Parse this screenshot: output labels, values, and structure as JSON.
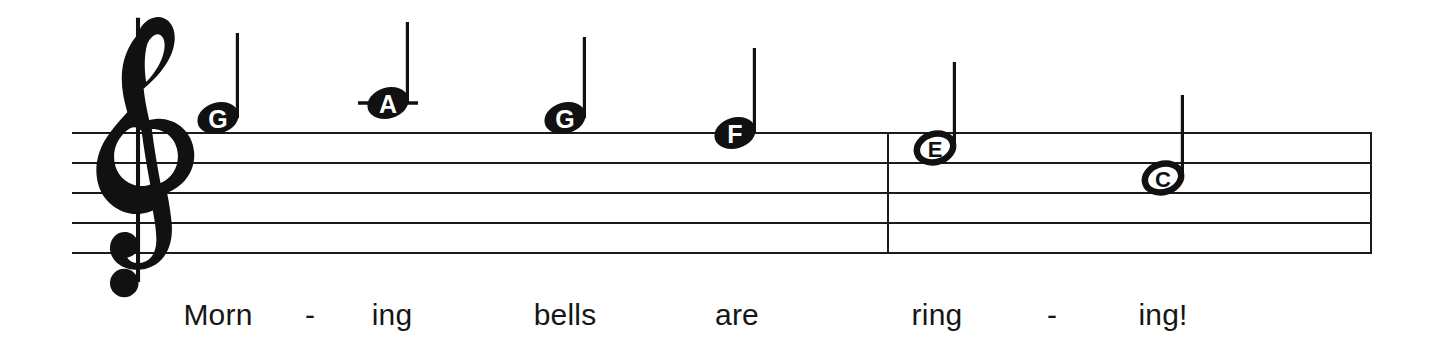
{
  "score": {
    "title_text": "",
    "clef": "treble-clef",
    "staff": {
      "left_x": 72,
      "right_x": 1372,
      "line_ys": [
        133,
        163,
        193,
        223,
        253
      ],
      "line_spacing": 30,
      "line_count": 5,
      "color": "#1a1a1a"
    },
    "barlines": [
      {
        "name": "middle-barline",
        "x": 888
      },
      {
        "name": "final-barline",
        "x": 1371
      }
    ],
    "notes": [
      {
        "letter": "G",
        "x": 218,
        "y": 118,
        "head": "filled",
        "duration": "quarter",
        "stem": "up",
        "stem_top_y": 33,
        "ledger": false,
        "lyric": "Morn"
      },
      {
        "letter": "A",
        "x": 388,
        "y": 103,
        "head": "filled",
        "duration": "quarter",
        "stem": "up",
        "stem_top_y": 22,
        "ledger": true,
        "lyric": "ing"
      },
      {
        "letter": "G",
        "x": 565,
        "y": 118,
        "head": "filled",
        "duration": "quarter",
        "stem": "up",
        "stem_top_y": 37,
        "ledger": false,
        "lyric": "bells"
      },
      {
        "letter": "F",
        "x": 735,
        "y": 133,
        "head": "filled",
        "duration": "quarter",
        "stem": "up",
        "stem_top_y": 48,
        "ledger": false,
        "lyric": "are"
      },
      {
        "letter": "E",
        "x": 935,
        "y": 148,
        "head": "open",
        "duration": "half",
        "stem": "up",
        "stem_top_y": 62,
        "ledger": false,
        "lyric": "ring"
      },
      {
        "letter": "C",
        "x": 1163,
        "y": 178,
        "head": "open",
        "duration": "half",
        "stem": "up",
        "stem_top_y": 95,
        "ledger": false,
        "lyric": "ing!"
      }
    ],
    "lyrics": [
      {
        "text": "Morn",
        "x": 218,
        "y": 300
      },
      {
        "text": "-",
        "x": 310,
        "y": 300
      },
      {
        "text": "ing",
        "x": 392,
        "y": 300
      },
      {
        "text": "bells",
        "x": 565,
        "y": 300
      },
      {
        "text": "are",
        "x": 737,
        "y": 300
      },
      {
        "text": "ring",
        "x": 937,
        "y": 300
      },
      {
        "text": "-",
        "x": 1052,
        "y": 300
      },
      {
        "text": "ing!",
        "x": 1163,
        "y": 300
      }
    ],
    "lyrics_sentence": "Morn - ing bells are ring - ing!"
  }
}
